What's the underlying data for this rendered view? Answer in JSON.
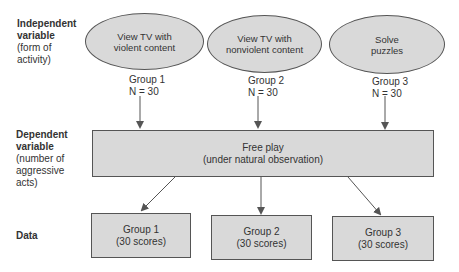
{
  "rows": {
    "independent": {
      "title": "Independent variable",
      "title_line1": "Independent",
      "title_line2": "variable",
      "desc_line1": "(form of",
      "desc_line2": "activity)"
    },
    "dependent": {
      "title_line1": "Dependent",
      "title_line2": "variable",
      "desc_line1": "(number of",
      "desc_line2": "aggressive",
      "desc_line3": "acts)"
    },
    "data": {
      "title": "Data"
    }
  },
  "conditions": [
    {
      "line1": "View TV with",
      "line2": "violent content",
      "group": "Group 1",
      "n": "N = 30"
    },
    {
      "line1": "View TV with",
      "line2": "nonviolent content",
      "group": "Group 2",
      "n": "N = 30"
    },
    {
      "line1": "Solve",
      "line2": "puzzles",
      "group": "Group 3",
      "n": "N = 30"
    }
  ],
  "free_play": {
    "line1": "Free play",
    "line2": "(under natural observation)"
  },
  "data_boxes": [
    {
      "line1": "Group 1",
      "line2": "(30 scores)"
    },
    {
      "line1": "Group 2",
      "line2": "(30 scores)"
    },
    {
      "line1": "Group 3",
      "line2": "(30 scores)"
    }
  ],
  "colors": {
    "fill": "#d9d9d9",
    "stroke": "#555555",
    "text": "#333333"
  }
}
